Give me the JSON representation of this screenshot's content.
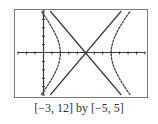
{
  "caption": "[−3, 12] by [−5, 5]",
  "colors": {
    "frame": "#7a7a7a",
    "curve": "#3a3a3a",
    "axis": "#3a3a3a",
    "background": "#ffffff"
  },
  "chart_data": {
    "type": "line",
    "title": "",
    "xlabel": "",
    "ylabel": "",
    "xlim": [
      -3,
      12
    ],
    "ylim": [
      -5,
      5
    ],
    "xscl": 1,
    "yscl": 1,
    "grid": false,
    "legend": null,
    "annotation": "[−3, 12] by [−5, 5]",
    "series": [
      {
        "name": "hyperbola-left-branch",
        "points": [
          [
            0.2,
            5
          ],
          [
            1.0,
            3.2
          ],
          [
            1.6,
            1.8
          ],
          [
            2.0,
            0
          ],
          [
            1.6,
            -1.8
          ],
          [
            1.0,
            -3.2
          ],
          [
            0.2,
            -5
          ]
        ]
      },
      {
        "name": "hyperbola-right-branch",
        "points": [
          [
            9.8,
            5
          ],
          [
            9.0,
            3.2
          ],
          [
            8.4,
            1.8
          ],
          [
            8.0,
            0
          ],
          [
            8.4,
            -1.8
          ],
          [
            9.0,
            -3.2
          ],
          [
            9.8,
            -5
          ]
        ]
      },
      {
        "name": "asymptote-1",
        "points": [
          [
            0.8,
            5
          ],
          [
            5,
            0
          ],
          [
            9.2,
            -5
          ]
        ]
      },
      {
        "name": "asymptote-2",
        "points": [
          [
            0.8,
            -5
          ],
          [
            5,
            0
          ],
          [
            9.2,
            5
          ]
        ]
      }
    ]
  }
}
